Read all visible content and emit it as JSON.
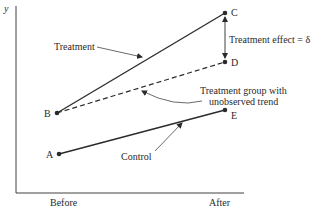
{
  "diagram": {
    "axes": {
      "y_label": "y",
      "x_ticks": [
        "Before",
        "After"
      ]
    },
    "points": {
      "A": {
        "label": "A"
      },
      "B": {
        "label": "B"
      },
      "C": {
        "label": "C"
      },
      "D": {
        "label": "D"
      },
      "E": {
        "label": "E"
      }
    },
    "lines": [
      {
        "from": "B",
        "to": "C",
        "style": "solid",
        "name": "Treatment"
      },
      {
        "from": "B",
        "to": "D",
        "style": "dashed",
        "name": "Treatment group with unobserved trend"
      },
      {
        "from": "A",
        "to": "E",
        "style": "solid",
        "name": "Control"
      }
    ],
    "annotations": {
      "treatment": "Treatment",
      "treatment_effect": "Treatment effect = δ",
      "unobserved_line1": "Treatment group with",
      "unobserved_line2": "unobserved trend",
      "control": "Control"
    },
    "colors": {
      "ink": "#2a2a2a",
      "background": "#ffffff"
    }
  }
}
